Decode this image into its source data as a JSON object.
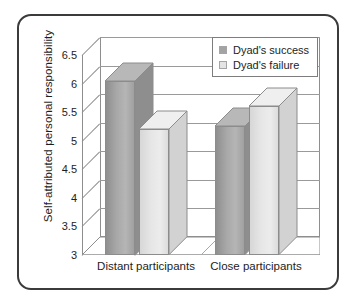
{
  "chart_data": {
    "type": "bar",
    "title": "",
    "subtitle": "",
    "xlabel": "",
    "ylabel": "Self-attributed personal responsibility",
    "categories": [
      "Distant participants",
      "Close participants"
    ],
    "series": [
      {
        "name": "Dyad's success",
        "values": [
          6.05,
          5.25
        ],
        "color": "#a3a3a3"
      },
      {
        "name": "Dyad's failure",
        "values": [
          5.2,
          5.6
        ],
        "color": "#e4e4e4"
      }
    ],
    "ylim": [
      3,
      6.5
    ],
    "ytick_labels": [
      "6.5",
      "6",
      "5.5",
      "5",
      "4.5",
      "4",
      "3.5",
      "3"
    ],
    "ytick_values": [
      6.5,
      6,
      5.5,
      5,
      4.5,
      4,
      3.5,
      3
    ],
    "grid": true,
    "legend_position": "top-right",
    "style": "3d-column",
    "colors": {
      "border": "#3b3b3b",
      "gridline": "#9a9a9a",
      "axis": "#8e8e8e",
      "text": "#1d1d1d",
      "background": "#ffffff"
    }
  }
}
